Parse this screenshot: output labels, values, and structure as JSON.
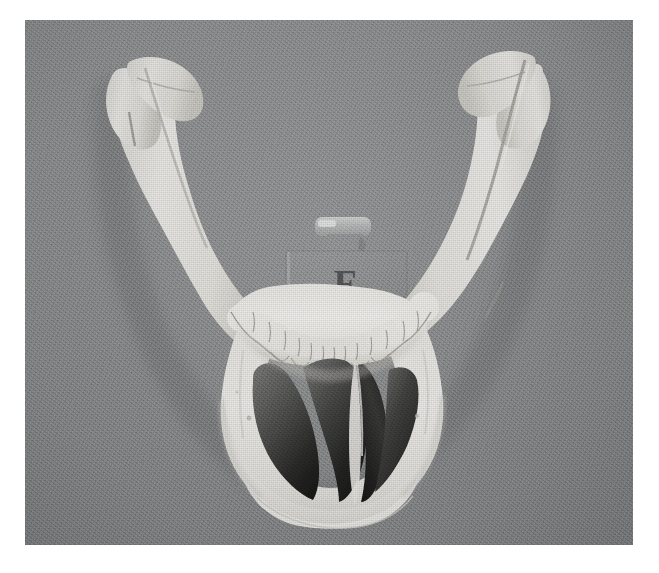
{
  "image": {
    "subject": "human mandible",
    "view": "anterior-superior",
    "plate_width": 608,
    "plate_height": 525,
    "plate_left": 25,
    "plate_top": 20,
    "page_background": "#ffffff",
    "background_color": "#8e9091",
    "bone_light": "#f2f1ee",
    "bone_mid": "#dedcd6",
    "bone_shadow": "#b9b7b1",
    "cavity_dark": "#1a1a1a",
    "cavity_mid": "#555555"
  },
  "specimen_label": {
    "letter": "F",
    "block_color": "#8a8c8d",
    "letter_color": "#3c3d3e",
    "tab_color": "#b9bbbb"
  },
  "anatomy": {
    "parts": [
      "left condylar process",
      "left coronoid process",
      "left ramus",
      "left gonial angle",
      "mandibular body",
      "dental arch",
      "mental symphysis",
      "right gonial angle",
      "right ramus",
      "right coronoid process",
      "right condylar process"
    ]
  }
}
